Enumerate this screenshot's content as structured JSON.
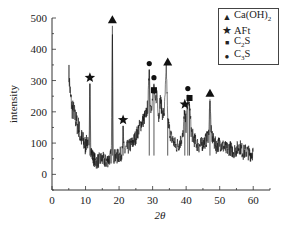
{
  "chart_data": {
    "type": "line",
    "title": "",
    "xlabel": "2θ",
    "ylabel": "intensity",
    "xlim": [
      0,
      65
    ],
    "ylim": [
      -50,
      500
    ],
    "xticks": [
      0,
      10,
      20,
      30,
      40,
      50,
      60
    ],
    "yticks": [
      0,
      100,
      200,
      300,
      400,
      500
    ],
    "grid": false,
    "legend_position": "top-right",
    "legend": [
      {
        "symbol": "triangle",
        "label": "Ca(OH)",
        "sub": "2"
      },
      {
        "symbol": "star",
        "label": "AFt",
        "sub": ""
      },
      {
        "symbol": "square",
        "label": "C",
        "sub": "2",
        "suffix": "S"
      },
      {
        "symbol": "circle",
        "label": "C",
        "sub": "3",
        "suffix": "S"
      }
    ],
    "series": [
      {
        "name": "XRD pattern",
        "x": [
          5,
          5.5,
          6,
          6.5,
          7,
          7.5,
          8,
          8.5,
          9,
          9.5,
          10,
          10.5,
          11,
          11.3,
          11.6,
          12,
          12.5,
          13,
          14,
          15,
          16,
          17,
          17.7,
          18.0,
          18.3,
          19,
          20,
          21,
          21.2,
          21.5,
          22,
          23,
          24,
          25,
          26,
          27,
          28,
          28.6,
          29.0,
          29.4,
          30,
          30.4,
          30.8,
          31.3,
          31.8,
          32.3,
          33,
          33.5,
          34.1,
          34.5,
          34.9,
          35.5,
          36,
          37,
          38,
          39,
          39.6,
          40,
          40.5,
          41.0,
          41.5,
          42,
          43,
          44,
          45,
          46,
          46.7,
          47.1,
          47.5,
          48,
          49,
          50,
          51,
          52,
          53,
          54,
          55,
          56,
          57,
          58,
          59,
          60
        ],
        "y": [
          330,
          250,
          210,
          200,
          180,
          160,
          150,
          120,
          110,
          100,
          90,
          110,
          80,
          290,
          80,
          60,
          50,
          40,
          45,
          50,
          40,
          50,
          60,
          475,
          60,
          55,
          60,
          70,
          155,
          70,
          80,
          90,
          100,
          120,
          150,
          170,
          190,
          220,
          335,
          210,
          240,
          290,
          220,
          270,
          180,
          240,
          190,
          200,
          340,
          180,
          150,
          120,
          110,
          90,
          100,
          120,
          205,
          150,
          255,
          225,
          140,
          120,
          100,
          90,
          100,
          110,
          130,
          240,
          130,
          110,
          90,
          100,
          90,
          80,
          85,
          75,
          80,
          90,
          70,
          75,
          65,
          70
        ]
      }
    ],
    "annotations": [
      {
        "symbol": "star",
        "x": 11.3,
        "y": 290,
        "phase": "AFt"
      },
      {
        "symbol": "triangle",
        "x": 18.0,
        "y": 475,
        "phase": "Ca(OH)2"
      },
      {
        "symbol": "star",
        "x": 21.2,
        "y": 155,
        "phase": "AFt"
      },
      {
        "symbol": "circle",
        "x": 29.0,
        "y": 335,
        "phase": "C3S"
      },
      {
        "symbol": "circle",
        "x": 30.4,
        "y": 290,
        "phase": "C3S"
      },
      {
        "symbol": "square",
        "x": 30.4,
        "y": 250,
        "phase": "C2S"
      },
      {
        "symbol": "triangle",
        "x": 34.5,
        "y": 340,
        "phase": "Ca(OH)2"
      },
      {
        "symbol": "star",
        "x": 39.6,
        "y": 205,
        "phase": "AFt"
      },
      {
        "symbol": "circle",
        "x": 40.5,
        "y": 255,
        "phase": "C3S"
      },
      {
        "symbol": "square",
        "x": 41.0,
        "y": 225,
        "phase": "C2S"
      },
      {
        "symbol": "triangle",
        "x": 47.1,
        "y": 240,
        "phase": "Ca(OH)2"
      }
    ]
  }
}
